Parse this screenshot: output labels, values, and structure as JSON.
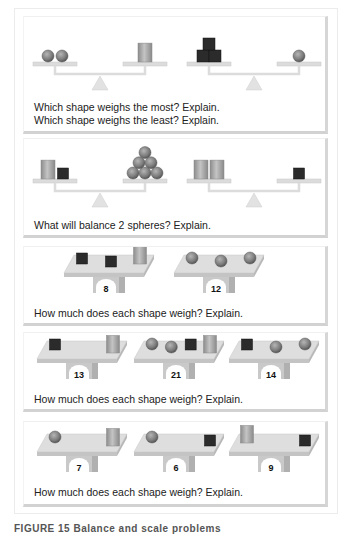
{
  "panels": [
    {
      "type": "balance",
      "questions": [
        "Which shape weighs the most? Explain.",
        "Which shape weighs the least? Explain."
      ],
      "scales": [
        {
          "left": [
            "sphere",
            "sphere"
          ],
          "right": [
            "cylinder"
          ]
        },
        {
          "left": [
            "cube",
            "cube",
            "cube"
          ],
          "right": [
            "sphere"
          ]
        }
      ]
    },
    {
      "type": "balance",
      "questions": [
        "What will balance 2 spheres? Explain."
      ],
      "scales": [
        {
          "left": [
            "cylinder",
            "cube"
          ],
          "right": [
            "sphere",
            "sphere",
            "sphere",
            "sphere",
            "sphere",
            "sphere"
          ]
        },
        {
          "left": [
            "cylinder",
            "cylinder"
          ],
          "right": [
            "cube"
          ]
        }
      ]
    },
    {
      "type": "platform",
      "questions": [
        "How much does each shape weigh? Explain."
      ],
      "platforms": [
        {
          "items": [
            "cube",
            "cube",
            "cylinder"
          ],
          "weight": "8"
        },
        {
          "items": [
            "sphere",
            "sphere",
            "sphere"
          ],
          "weight": "12"
        }
      ]
    },
    {
      "type": "platform",
      "questions": [
        "How much does each shape weigh? Explain."
      ],
      "platforms": [
        {
          "items": [
            "cube",
            "cylinder"
          ],
          "weight": "13"
        },
        {
          "items": [
            "sphere",
            "sphere",
            "cube",
            "cylinder"
          ],
          "weight": "21"
        },
        {
          "items": [
            "cube",
            "sphere",
            "sphere"
          ],
          "weight": "14"
        }
      ]
    },
    {
      "type": "platform",
      "questions": [
        "How much does each shape weigh? Explain."
      ],
      "platforms": [
        {
          "items": [
            "sphere",
            "cylinder"
          ],
          "weight": "7"
        },
        {
          "items": [
            "sphere",
            "cube"
          ],
          "weight": "6"
        },
        {
          "items": [
            "cylinder",
            "cube"
          ],
          "weight": "9"
        }
      ]
    }
  ],
  "caption": "FIGURE 15  Balance and scale problems",
  "colors": {
    "cube": "#2b2b2b",
    "sphere": "#7a7a7a",
    "cylinder": "#a8a8a8",
    "scale": "#dcdcdc",
    "platform": "#d4d4d4"
  }
}
